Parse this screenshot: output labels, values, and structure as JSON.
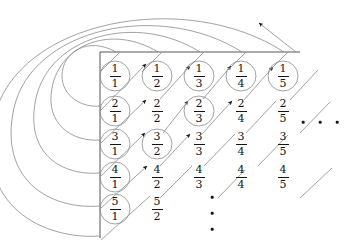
{
  "figure": {
    "name": "cantor-diagonal-enumeration-of-rationals",
    "ink_color": "#141414",
    "line_color": "#8a8a8a",
    "axis_color": "#555555"
  },
  "grid": {
    "columns": 5,
    "rows": 5,
    "column_x": [
      115,
      157,
      199,
      241,
      283
    ],
    "row_y": [
      76,
      112,
      145,
      178,
      210
    ],
    "cells": [
      [
        {
          "num": "1",
          "den": "1",
          "circled": true
        },
        {
          "num": "1",
          "den": "2",
          "circled": true
        },
        {
          "num": "1",
          "den": "3",
          "circled": true
        },
        {
          "num": "1",
          "den": "4",
          "circled": true
        },
        {
          "num": "1",
          "den": "5",
          "circled": true
        }
      ],
      [
        {
          "num": "2",
          "den": "1",
          "circled": true
        },
        {
          "num": "2",
          "den": "2",
          "circled": false
        },
        {
          "num": "2",
          "den": "3",
          "circled": true
        },
        {
          "num": "2",
          "den": "4",
          "circled": false
        },
        {
          "num": "2",
          "den": "5",
          "circled": false
        }
      ],
      [
        {
          "num": "3",
          "den": "1",
          "circled": true
        },
        {
          "num": "3",
          "den": "2",
          "circled": true
        },
        {
          "num": "3",
          "den": "3",
          "circled": false
        },
        {
          "num": "3",
          "den": "4",
          "circled": false
        },
        {
          "num": "3",
          "den": "5",
          "circled": false
        }
      ],
      [
        {
          "num": "4",
          "den": "1",
          "circled": true
        },
        {
          "num": "4",
          "den": "2",
          "circled": false
        },
        {
          "num": "4",
          "den": "3",
          "circled": false
        },
        {
          "num": "4",
          "den": "4",
          "circled": false
        },
        {
          "num": "4",
          "den": "5",
          "circled": false
        }
      ],
      [
        {
          "num": "5",
          "den": "1",
          "circled": true
        },
        {
          "num": "5",
          "den": "2",
          "circled": false
        },
        {
          "num": "",
          "den": "",
          "circled": false
        },
        {
          "num": "",
          "den": "",
          "circled": false
        },
        {
          "num": "",
          "den": "",
          "circled": false
        }
      ]
    ]
  },
  "ellipses": {
    "horizontal": {
      "label": "...",
      "dots": 3,
      "x": [
        303,
        320,
        337
      ],
      "y": 122
    },
    "vertical": {
      "label": "⋮",
      "dots": 3,
      "x": 212,
      "y": [
        197,
        213,
        229
      ]
    }
  },
  "axes": {
    "corner_x": 100,
    "corner_y": 52,
    "top_line_to_x": 300,
    "left_line_to_y": 238
  },
  "exit_arrow": {
    "name": "continue-arrow",
    "from_x": 296,
    "from_y": 52,
    "to_x": 258,
    "to_y": 22
  }
}
